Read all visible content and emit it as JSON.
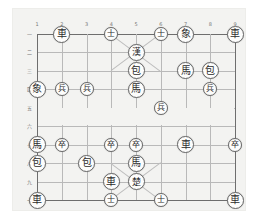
{
  "app": {
    "title": "Xiangqi Board Position",
    "background_color": "#ffffff",
    "board_color": "#f3f3f1",
    "line_color": "#b9b9b9",
    "edge_color": "#6e6e6e",
    "piece_face_color": "#fdfdfc",
    "piece_text_color": "#2c2c2c"
  },
  "board": {
    "files": 9,
    "ranks": 10,
    "file_labels": [
      "1",
      "2",
      "3",
      "4",
      "5",
      "6",
      "7",
      "8",
      "9"
    ],
    "rank_labels": [
      "一",
      "二",
      "三",
      "四",
      "五",
      "六",
      "七",
      "八",
      "九",
      "十"
    ]
  },
  "pieces": [
    {
      "name": "chariot",
      "label": "車",
      "file": 2,
      "rank": 1,
      "size": "normal"
    },
    {
      "name": "advisor",
      "label": "士",
      "file": 4,
      "rank": 1,
      "size": "small"
    },
    {
      "name": "advisor",
      "label": "士",
      "file": 6,
      "rank": 1,
      "size": "small"
    },
    {
      "name": "elephant",
      "label": "象",
      "file": 7,
      "rank": 1,
      "size": "normal"
    },
    {
      "name": "chariot",
      "label": "車",
      "file": 9,
      "rank": 1,
      "size": "normal"
    },
    {
      "name": "general-han",
      "label": "漢",
      "file": 5,
      "rank": 2,
      "size": "normal"
    },
    {
      "name": "cannon",
      "label": "包",
      "file": 5,
      "rank": 3,
      "size": "normal"
    },
    {
      "name": "horse",
      "label": "馬",
      "file": 7,
      "rank": 3,
      "size": "normal"
    },
    {
      "name": "cannon",
      "label": "包",
      "file": 8,
      "rank": 3,
      "size": "normal"
    },
    {
      "name": "elephant",
      "label": "象",
      "file": 1,
      "rank": 4,
      "size": "normal"
    },
    {
      "name": "soldier",
      "label": "兵",
      "file": 2,
      "rank": 4,
      "size": "small"
    },
    {
      "name": "soldier",
      "label": "兵",
      "file": 3,
      "rank": 4,
      "size": "small"
    },
    {
      "name": "horse",
      "label": "馬",
      "file": 5,
      "rank": 4,
      "size": "normal"
    },
    {
      "name": "soldier",
      "label": "兵",
      "file": 8,
      "rank": 4,
      "size": "small"
    },
    {
      "name": "soldier",
      "label": "兵",
      "file": 6,
      "rank": 5,
      "size": "small"
    },
    {
      "name": "horse",
      "label": "馬",
      "file": 1,
      "rank": 7,
      "size": "normal"
    },
    {
      "name": "soldier",
      "label": "卒",
      "file": 2,
      "rank": 7,
      "size": "small"
    },
    {
      "name": "soldier",
      "label": "卒",
      "file": 4,
      "rank": 7,
      "size": "small"
    },
    {
      "name": "soldier",
      "label": "卒",
      "file": 5,
      "rank": 7,
      "size": "small"
    },
    {
      "name": "chariot",
      "label": "車",
      "file": 7,
      "rank": 7,
      "size": "normal"
    },
    {
      "name": "soldier",
      "label": "卒",
      "file": 9,
      "rank": 7,
      "size": "small"
    },
    {
      "name": "cannon",
      "label": "包",
      "file": 1,
      "rank": 8,
      "size": "normal"
    },
    {
      "name": "cannon",
      "label": "包",
      "file": 3,
      "rank": 8,
      "size": "normal"
    },
    {
      "name": "horse",
      "label": "馬",
      "file": 5,
      "rank": 8,
      "size": "normal"
    },
    {
      "name": "chariot",
      "label": "車",
      "file": 4,
      "rank": 9,
      "size": "normal"
    },
    {
      "name": "general-chu",
      "label": "楚",
      "file": 5,
      "rank": 9,
      "size": "normal"
    },
    {
      "name": "chariot",
      "label": "車",
      "file": 1,
      "rank": 10,
      "size": "normal"
    },
    {
      "name": "advisor",
      "label": "士",
      "file": 4,
      "rank": 10,
      "size": "small"
    },
    {
      "name": "advisor",
      "label": "士",
      "file": 6,
      "rank": 10,
      "size": "small"
    },
    {
      "name": "chariot",
      "label": "車",
      "file": 9,
      "rank": 10,
      "size": "normal"
    }
  ]
}
